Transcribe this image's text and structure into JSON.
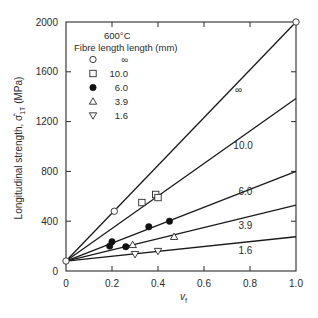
{
  "chart_data": {
    "type": "line",
    "title": "600°C",
    "xlabel": "v_f",
    "ylabel": "Longitudinal strength, σ̂1T (MPa)",
    "xlim": [
      0,
      1.0
    ],
    "ylim": [
      0,
      2000
    ],
    "x_ticks": [
      "0",
      "0.2",
      "0.4",
      "0.6",
      "0.8",
      "1.0"
    ],
    "y_ticks": [
      "0",
      "400",
      "800",
      "1200",
      "1600",
      "2000"
    ],
    "grid": false,
    "legend": {
      "title": "Fibre length length (mm)",
      "position": "upper-left",
      "entries": [
        {
          "marker": "open-circle",
          "label": "∞"
        },
        {
          "marker": "open-square",
          "label": "10.0"
        },
        {
          "marker": "filled-circle",
          "label": "6.0"
        },
        {
          "marker": "open-triangle-up",
          "label": "3.9"
        },
        {
          "marker": "open-triangle-down",
          "label": "1.6"
        }
      ]
    },
    "series": [
      {
        "name": "∞",
        "marker": "open-circle",
        "line": {
          "x": [
            0,
            1.0
          ],
          "y": [
            80,
            2000
          ]
        },
        "line_label": "∞",
        "line_label_pos": [
          0.75,
          1430
        ],
        "points": [
          {
            "x": 0.21,
            "y": 480
          },
          {
            "x": 1.0,
            "y": 2000
          },
          {
            "x": 0,
            "y": 80
          }
        ]
      },
      {
        "name": "10.0",
        "marker": "open-square",
        "line": {
          "x": [
            0,
            1.0
          ],
          "y": [
            80,
            1385
          ]
        },
        "line_label": "10.0",
        "line_label_pos": [
          0.77,
          980
        ],
        "points": [
          {
            "x": 0.33,
            "y": 550
          },
          {
            "x": 0.39,
            "y": 615
          },
          {
            "x": 0.4,
            "y": 590
          }
        ]
      },
      {
        "name": "6.0",
        "marker": "filled-circle",
        "line": {
          "x": [
            0,
            1.0
          ],
          "y": [
            80,
            800
          ]
        },
        "line_label": "6.0",
        "line_label_pos": [
          0.78,
          610
        ],
        "points": [
          {
            "x": 0.19,
            "y": 200
          },
          {
            "x": 0.2,
            "y": 235
          },
          {
            "x": 0.26,
            "y": 195
          },
          {
            "x": 0.36,
            "y": 355
          },
          {
            "x": 0.45,
            "y": 400
          }
        ]
      },
      {
        "name": "3.9",
        "marker": "open-triangle-up",
        "line": {
          "x": [
            0,
            1.0
          ],
          "y": [
            80,
            530
          ]
        },
        "line_label": "3.9",
        "line_label_pos": [
          0.78,
          340
        ],
        "points": [
          {
            "x": 0.29,
            "y": 210
          },
          {
            "x": 0.47,
            "y": 275
          }
        ]
      },
      {
        "name": "1.6",
        "marker": "open-triangle-down",
        "line": {
          "x": [
            0,
            1.0
          ],
          "y": [
            80,
            275
          ]
        },
        "line_label": "1.6",
        "line_label_pos": [
          0.78,
          140
        ],
        "points": [
          {
            "x": 0.3,
            "y": 135
          },
          {
            "x": 0.4,
            "y": 160
          }
        ]
      }
    ]
  }
}
